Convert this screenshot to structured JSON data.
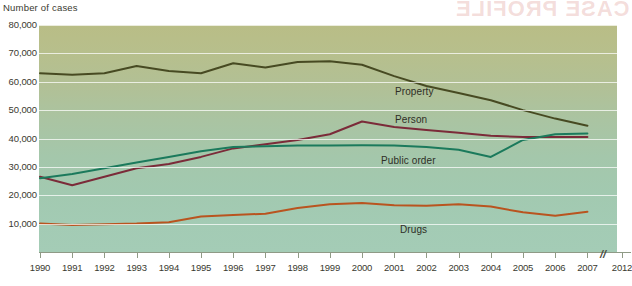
{
  "axis_title": "Number of cases",
  "bleed_text": "CASE PROFILE",
  "colors": {
    "property": "#474a22",
    "person": "#7b2b39",
    "public_order": "#1b7a5c",
    "drugs": "#b9541f",
    "grid": "#ffffff",
    "plot_top": "#b9bd86",
    "plot_bottom": "#a4ccb6"
  },
  "chart_data": {
    "type": "line",
    "title": "",
    "xlabel": "",
    "ylabel": "Number of cases",
    "ylim": [
      0,
      80000
    ],
    "ytick_labels": [
      "80,000",
      "70,000",
      "60,000",
      "50,000",
      "40,000",
      "30,000",
      "20,000",
      "10,000"
    ],
    "ytick_values": [
      80000,
      70000,
      60000,
      50000,
      40000,
      30000,
      20000,
      10000
    ],
    "grid": true,
    "legend_position": "inline-labels",
    "axis_break": {
      "symbol": "//",
      "between": [
        "2007",
        "2012"
      ]
    },
    "x": [
      "1990",
      "1991",
      "1992",
      "1993",
      "1994",
      "1995",
      "1996",
      "1997",
      "1998",
      "1999",
      "2000",
      "2001",
      "2002",
      "2003",
      "2004",
      "2005",
      "2006",
      "2007"
    ],
    "xtick_labels": [
      "1990",
      "1991",
      "1992",
      "1993",
      "1994",
      "1995",
      "1996",
      "1997",
      "1998",
      "1999",
      "2000",
      "2001",
      "2002",
      "2003",
      "2004",
      "2005",
      "2006",
      "2007",
      "2012"
    ],
    "series": [
      {
        "name": "Property",
        "color": "#474a22",
        "label": "Property",
        "values": [
          63000,
          62500,
          63000,
          65500,
          63800,
          63000,
          66500,
          65000,
          67000,
          67200,
          66000,
          62000,
          58500,
          56000,
          53500,
          50000,
          47000,
          44500
        ]
      },
      {
        "name": "Person",
        "color": "#7b2b39",
        "label": "Person",
        "values": [
          26500,
          23500,
          26500,
          29500,
          31000,
          33500,
          36500,
          38000,
          39500,
          41500,
          46000,
          44000,
          43000,
          42000,
          41000,
          40500,
          40500,
          40500
        ]
      },
      {
        "name": "Public order",
        "color": "#1b7a5c",
        "label": "Public order",
        "values": [
          26000,
          27500,
          29500,
          31500,
          33500,
          35500,
          37000,
          37300,
          37500,
          37500,
          37600,
          37500,
          37000,
          36000,
          33500,
          39500,
          41500,
          41800
        ]
      },
      {
        "name": "Drugs",
        "color": "#b9541f",
        "label": "Drugs",
        "values": [
          10000,
          9500,
          9800,
          10000,
          10500,
          12500,
          13000,
          13500,
          15500,
          16800,
          17300,
          16500,
          16300,
          16800,
          16000,
          14000,
          12800,
          14200
        ]
      }
    ]
  },
  "series_label_positions": [
    {
      "name": "property-label",
      "left": 395,
      "top": 86
    },
    {
      "name": "person-label",
      "left": 395,
      "top": 114
    },
    {
      "name": "public-order-label",
      "left": 381,
      "top": 155
    },
    {
      "name": "drugs-label",
      "left": 400,
      "top": 224
    }
  ]
}
